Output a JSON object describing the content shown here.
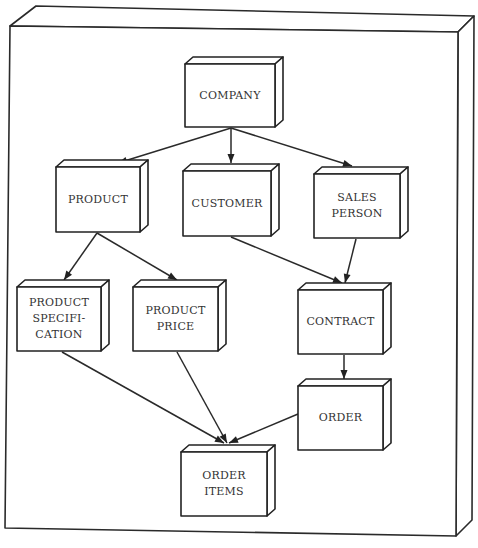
{
  "diagram": {
    "type": "entity-hierarchy",
    "frame": {
      "front": [
        [
          10,
          26
        ],
        [
          458,
          32
        ],
        [
          456,
          536
        ],
        [
          5,
          528
        ]
      ],
      "depth": [
        16,
        -16
      ]
    },
    "nodes": [
      {
        "id": "company",
        "lines": [
          "COMPANY"
        ],
        "x": 185,
        "y": 64,
        "w": 90,
        "h": 63
      },
      {
        "id": "product",
        "lines": [
          "PRODUCT"
        ],
        "x": 56,
        "y": 167,
        "w": 84,
        "h": 65
      },
      {
        "id": "customer",
        "lines": [
          "CUSTOMER"
        ],
        "x": 183,
        "y": 171,
        "w": 88,
        "h": 65
      },
      {
        "id": "sales_person",
        "lines": [
          "SALES",
          "PERSON"
        ],
        "x": 314,
        "y": 174,
        "w": 86,
        "h": 64
      },
      {
        "id": "product_specification",
        "lines": [
          "PRODUCT",
          "SPECIFI-",
          "CATION"
        ],
        "x": 17,
        "y": 287,
        "w": 84,
        "h": 64
      },
      {
        "id": "product_price",
        "lines": [
          "PRODUCT",
          "PRICE"
        ],
        "x": 133,
        "y": 287,
        "w": 85,
        "h": 64
      },
      {
        "id": "contract",
        "lines": [
          "CONTRACT"
        ],
        "x": 298,
        "y": 290,
        "w": 85,
        "h": 64
      },
      {
        "id": "order",
        "lines": [
          "ORDER"
        ],
        "x": 298,
        "y": 386,
        "w": 85,
        "h": 64
      },
      {
        "id": "order_items",
        "lines": [
          "ORDER",
          "ITEMS"
        ],
        "x": 181,
        "y": 452,
        "w": 86,
        "h": 64
      }
    ],
    "node_depth": [
      8,
      -7
    ],
    "edges": [
      {
        "from": "company",
        "to": "product",
        "points": [
          [
            231,
            128
          ],
          [
            118,
            163
          ]
        ]
      },
      {
        "from": "company",
        "to": "customer",
        "points": [
          [
            231,
            128
          ],
          [
            231,
            163
          ]
        ]
      },
      {
        "from": "company",
        "to": "sales_person",
        "points": [
          [
            231,
            128
          ],
          [
            352,
            166
          ]
        ]
      },
      {
        "from": "product",
        "to": "product_specification",
        "points": [
          [
            97,
            233
          ],
          [
            64,
            280
          ]
        ]
      },
      {
        "from": "product",
        "to": "product_price",
        "points": [
          [
            97,
            233
          ],
          [
            177,
            280
          ]
        ]
      },
      {
        "from": "customer",
        "to": "contract",
        "points": [
          [
            231,
            237
          ],
          [
            342,
            283
          ]
        ]
      },
      {
        "from": "sales_person",
        "to": "contract",
        "points": [
          [
            356,
            239
          ],
          [
            345,
            283
          ]
        ]
      },
      {
        "from": "contract",
        "to": "order",
        "points": [
          [
            344,
            355
          ],
          [
            344,
            379
          ]
        ]
      },
      {
        "from": "product_specification",
        "to": "order_items",
        "points": [
          [
            62,
            352
          ],
          [
            224,
            443
          ]
        ]
      },
      {
        "from": "product_price",
        "to": "order_items",
        "points": [
          [
            177,
            352
          ],
          [
            227,
            443
          ]
        ]
      },
      {
        "from": "order",
        "to": "order_items",
        "points": [
          [
            298,
            414
          ],
          [
            229,
            443
          ]
        ]
      }
    ],
    "colors": {
      "stroke": "#222222",
      "fill": "#ffffff",
      "text": "#333333"
    }
  }
}
